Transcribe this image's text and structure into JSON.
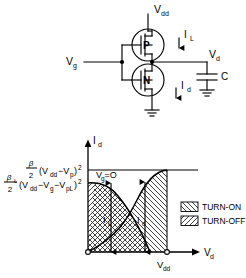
{
  "figure": {
    "circuit": {
      "supply_label": "V",
      "supply_sub": "dd",
      "gate_label": "V",
      "gate_sub": "g",
      "output_label": "V",
      "output_sub": "d",
      "pmos_label": "P",
      "nmos_label": "N",
      "load_current_label": "I",
      "load_current_sub": "L",
      "drain_current_label": "I",
      "drain_current_sub": "d",
      "capacitor_label": "C"
    },
    "plot": {
      "y_axis_label": "I",
      "y_axis_sub": "d",
      "x_axis_label": "V",
      "x_axis_sub": "d",
      "x_tick_label": "V",
      "x_tick_sub": "dd",
      "annotation": "V",
      "annotation_sub": "g",
      "annotation_rest": "=O",
      "curve_left_label": "I",
      "curve_left_sub": "L",
      "curve_right_label": "I",
      "curve_right_sub": "d",
      "y_level_1": {
        "numer": "β",
        "denom": "2",
        "body": "(V",
        "body_sub1": "dd",
        "body_mid": "−V",
        "body_sub2": "p",
        "body_end": ")",
        "exponent": "2"
      },
      "y_level_2": {
        "numer": "β",
        "numer_sub": "L",
        "denom": "2",
        "body": "(V",
        "body_sub1": "dd",
        "body_mid": "−V",
        "body_sub2": "g",
        "body_mid2": "−V",
        "body_sub3": "pL",
        "body_end": ")",
        "exponent": "2"
      }
    },
    "legend": {
      "items": [
        {
          "label": "TURN-ON",
          "pattern": "backslash-hatch"
        },
        {
          "label": "TURN-OFF",
          "pattern": "forwardslash-hatch"
        }
      ]
    },
    "colors": {
      "line": "#000000",
      "background": "#ffffff",
      "hatch": "#3a3a3a"
    }
  }
}
